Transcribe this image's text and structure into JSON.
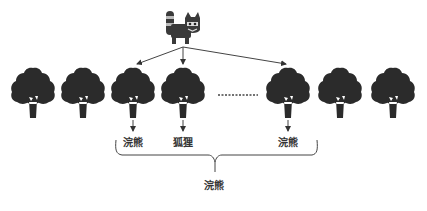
{
  "diagram": {
    "type": "tree-selection",
    "colors": {
      "ink": "#2b2b2b",
      "line": "#444444",
      "background": "#ffffff"
    },
    "top_icon": {
      "name": "raccoon-icon",
      "x": 180,
      "y": 28
    },
    "trees": [
      {
        "id": 1,
        "x": 33
      },
      {
        "id": 2,
        "x": 83
      },
      {
        "id": 3,
        "x": 133,
        "label": "浣熊"
      },
      {
        "id": 4,
        "x": 183,
        "label": "狐狸"
      },
      {
        "id": 5,
        "x": 288,
        "label": "浣熊"
      },
      {
        "id": 6,
        "x": 340
      },
      {
        "id": 7,
        "x": 393
      }
    ],
    "ellipsis": "……",
    "labels": {
      "tree3": "浣熊",
      "tree4": "狐狸",
      "tree5": "浣熊",
      "bracket": "浣熊"
    }
  }
}
